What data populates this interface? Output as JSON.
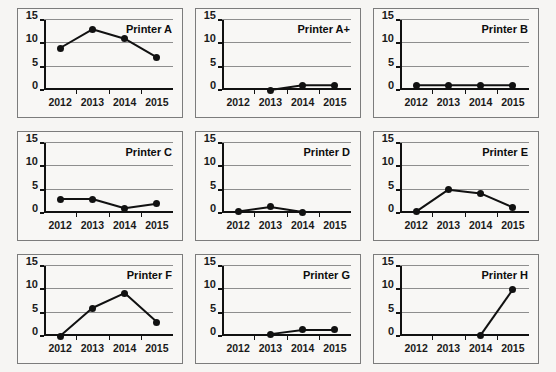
{
  "figure": {
    "panel_count": 9,
    "shared_x_categories": [
      "2012",
      "2013",
      "2014",
      "2015"
    ],
    "shared_y_ticks": [
      "0",
      "5",
      "10",
      "15"
    ]
  },
  "chart_data": [
    {
      "type": "line",
      "title": "Printer A",
      "categories": [
        "2012",
        "2013",
        "2014",
        "2015"
      ],
      "values": [
        9,
        13,
        11,
        7
      ],
      "xlabel": "",
      "ylabel": "",
      "ylim": [
        0,
        15
      ],
      "yticks": [
        0,
        5,
        10,
        15
      ],
      "grid": true,
      "legend": "none",
      "marker": "filled-circle"
    },
    {
      "type": "line",
      "title": "Printer A+",
      "categories": [
        "2012",
        "2013",
        "2014",
        "2015"
      ],
      "values": [
        null,
        0,
        1,
        1
      ],
      "xlabel": "",
      "ylabel": "",
      "ylim": [
        0,
        15
      ],
      "yticks": [
        0,
        5,
        10,
        15
      ],
      "grid": true,
      "legend": "none",
      "marker": "filled-circle"
    },
    {
      "type": "line",
      "title": "Printer B",
      "categories": [
        "2012",
        "2013",
        "2014",
        "2015"
      ],
      "values": [
        1,
        1,
        1,
        1
      ],
      "xlabel": "",
      "ylabel": "",
      "ylim": [
        0,
        15
      ],
      "yticks": [
        0,
        5,
        10,
        15
      ],
      "grid": true,
      "legend": "none",
      "marker": "filled-circle"
    },
    {
      "type": "line",
      "title": "Printer C",
      "categories": [
        "2012",
        "2013",
        "2014",
        "2015"
      ],
      "values": [
        3,
        3,
        1,
        2
      ],
      "xlabel": "",
      "ylabel": "",
      "ylim": [
        0,
        15
      ],
      "yticks": [
        0,
        5,
        10,
        15
      ],
      "grid": true,
      "legend": "none",
      "marker": "filled-circle"
    },
    {
      "type": "line",
      "title": "Printer D",
      "categories": [
        "2012",
        "2013",
        "2014",
        "2015"
      ],
      "values": [
        0.3,
        1.3,
        0.2,
        null
      ],
      "xlabel": "",
      "ylabel": "",
      "ylim": [
        0,
        15
      ],
      "yticks": [
        0,
        5,
        10,
        15
      ],
      "grid": true,
      "legend": "none",
      "marker": "filled-circle"
    },
    {
      "type": "line",
      "title": "Printer E",
      "categories": [
        "2012",
        "2013",
        "2014",
        "2015"
      ],
      "values": [
        0.3,
        5,
        4.2,
        1.2
      ],
      "xlabel": "",
      "ylabel": "",
      "ylim": [
        0,
        15
      ],
      "yticks": [
        0,
        5,
        10,
        15
      ],
      "grid": true,
      "legend": "none",
      "marker": "filled-circle"
    },
    {
      "type": "line",
      "title": "Printer F",
      "categories": [
        "2012",
        "2013",
        "2014",
        "2015"
      ],
      "values": [
        0,
        6,
        9.2,
        3
      ],
      "xlabel": "",
      "ylabel": "",
      "ylim": [
        0,
        15
      ],
      "yticks": [
        0,
        5,
        10,
        15
      ],
      "grid": true,
      "legend": "none",
      "marker": "filled-circle"
    },
    {
      "type": "line",
      "title": "Printer G",
      "categories": [
        "2012",
        "2013",
        "2014",
        "2015"
      ],
      "values": [
        null,
        0.4,
        1.3,
        1.3
      ],
      "xlabel": "",
      "ylabel": "",
      "ylim": [
        0,
        15
      ],
      "yticks": [
        0,
        5,
        10,
        15
      ],
      "grid": true,
      "legend": "none",
      "marker": "filled-circle"
    },
    {
      "type": "line",
      "title": "Printer H",
      "categories": [
        "2012",
        "2013",
        "2014",
        "2015"
      ],
      "values": [
        null,
        null,
        0.2,
        10
      ],
      "xlabel": "",
      "ylabel": "",
      "ylim": [
        0,
        15
      ],
      "yticks": [
        0,
        5,
        10,
        15
      ],
      "grid": true,
      "legend": "none",
      "marker": "filled-circle"
    }
  ],
  "colors": {
    "line": "#111111",
    "marker": "#111111",
    "gridline": "#8e8e8e",
    "axis": "#111111",
    "panel_border": "#7c7c7c",
    "background": "#f6f5f3"
  }
}
